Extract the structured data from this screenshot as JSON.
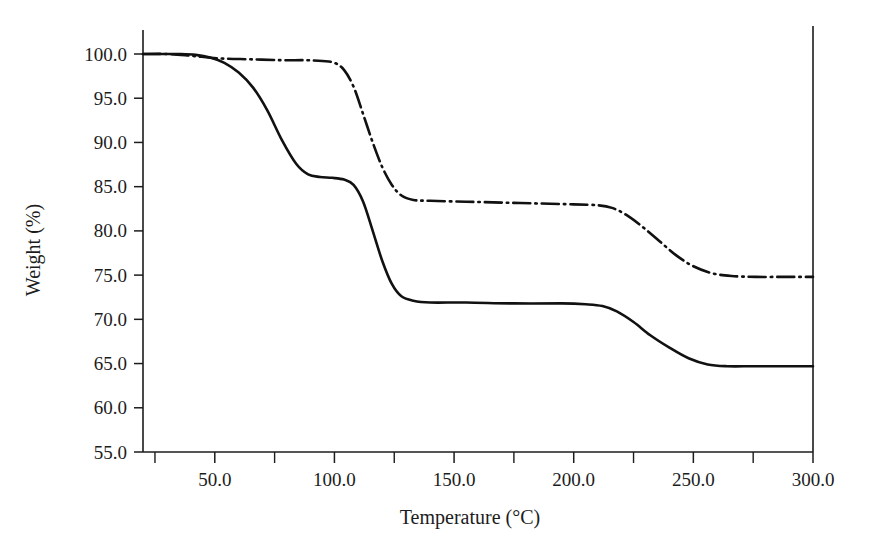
{
  "chart_data": {
    "type": "line",
    "title": "",
    "xlabel": "Temperature (°C)",
    "ylabel": "Weight (%)",
    "xlim": [
      20,
      300
    ],
    "ylim": [
      55,
      100
    ],
    "xticks": [
      50,
      100,
      150,
      200,
      250,
      300
    ],
    "xtick_labels": [
      "50.0",
      "100.0",
      "150.0",
      "200.0",
      "250.0",
      "300.0"
    ],
    "yticks": [
      55,
      60,
      65,
      70,
      75,
      80,
      85,
      90,
      95,
      100
    ],
    "ytick_labels": [
      "55.0",
      "60.0",
      "65.0",
      "70.0",
      "75.0",
      "80.0",
      "85.0",
      "90.0",
      "95.0",
      "100.0"
    ],
    "x_minor_tick_interval": 25,
    "grid": false,
    "legend": "none",
    "series": [
      {
        "name": "solid-curve",
        "style": "solid",
        "color": "#111111",
        "points": [
          [
            20,
            100.0
          ],
          [
            28,
            100.0
          ],
          [
            36,
            100.0
          ],
          [
            42,
            99.9
          ],
          [
            48,
            99.6
          ],
          [
            54,
            99.0
          ],
          [
            60,
            97.9
          ],
          [
            66,
            96.2
          ],
          [
            72,
            93.6
          ],
          [
            78,
            90.3
          ],
          [
            84,
            87.6
          ],
          [
            89,
            86.4
          ],
          [
            94,
            86.1
          ],
          [
            99,
            86.0
          ],
          [
            104,
            85.8
          ],
          [
            108,
            85.2
          ],
          [
            112,
            83.3
          ],
          [
            116,
            80.0
          ],
          [
            120,
            76.6
          ],
          [
            124,
            74.0
          ],
          [
            128,
            72.6
          ],
          [
            133,
            72.1
          ],
          [
            140,
            71.9
          ],
          [
            155,
            71.9
          ],
          [
            175,
            71.8
          ],
          [
            195,
            71.8
          ],
          [
            205,
            71.7
          ],
          [
            212,
            71.5
          ],
          [
            218,
            70.9
          ],
          [
            225,
            69.7
          ],
          [
            232,
            68.2
          ],
          [
            240,
            66.8
          ],
          [
            248,
            65.6
          ],
          [
            256,
            64.9
          ],
          [
            264,
            64.7
          ],
          [
            275,
            64.7
          ],
          [
            288,
            64.7
          ],
          [
            300,
            64.7
          ]
        ]
      },
      {
        "name": "dash-dot-curve",
        "style": "dashdot",
        "color": "#111111",
        "points": [
          [
            20,
            100.0
          ],
          [
            30,
            100.0
          ],
          [
            40,
            99.8
          ],
          [
            52,
            99.5
          ],
          [
            65,
            99.4
          ],
          [
            78,
            99.3
          ],
          [
            88,
            99.3
          ],
          [
            95,
            99.2
          ],
          [
            100,
            99.0
          ],
          [
            104,
            98.2
          ],
          [
            108,
            96.3
          ],
          [
            112,
            93.2
          ],
          [
            116,
            90.0
          ],
          [
            120,
            87.2
          ],
          [
            124,
            85.2
          ],
          [
            128,
            84.0
          ],
          [
            133,
            83.5
          ],
          [
            140,
            83.4
          ],
          [
            155,
            83.3
          ],
          [
            170,
            83.2
          ],
          [
            185,
            83.1
          ],
          [
            200,
            83.0
          ],
          [
            210,
            82.9
          ],
          [
            216,
            82.6
          ],
          [
            222,
            81.8
          ],
          [
            229,
            80.4
          ],
          [
            236,
            78.8
          ],
          [
            243,
            77.2
          ],
          [
            250,
            76.0
          ],
          [
            258,
            75.2
          ],
          [
            266,
            74.9
          ],
          [
            276,
            74.8
          ],
          [
            288,
            74.8
          ],
          [
            300,
            74.8
          ]
        ]
      }
    ]
  },
  "figure": {
    "background_color": "#ffffff",
    "axis_color": "#1c1c1c"
  }
}
